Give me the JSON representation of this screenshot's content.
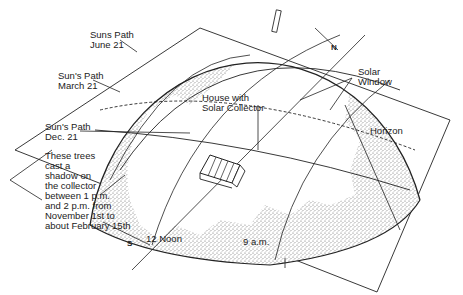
{
  "diagram": {
    "labels": {
      "suns_path_june": "Suns Path\nJune 21",
      "suns_path_march": "Sun's Path\nMarch 21",
      "suns_path_dec": "Sun's Path\nDec. 21",
      "trees_note": "These trees\ncast a\nshadow on\nthe collector\nbetween 1 p.m.\nand 2 p.m. from\nNovember 1st to\nabout February 15th",
      "house": "House with\nSolar Collector",
      "solar_window": "Solar\nWindow",
      "horizon": "Horizon",
      "north": "N",
      "south": "S",
      "noon": "12 Noon",
      "nine_am": "9 a.m."
    },
    "colors": {
      "ink": "#222222",
      "stipple": "#8a8a8a",
      "background": "#ffffff"
    }
  }
}
